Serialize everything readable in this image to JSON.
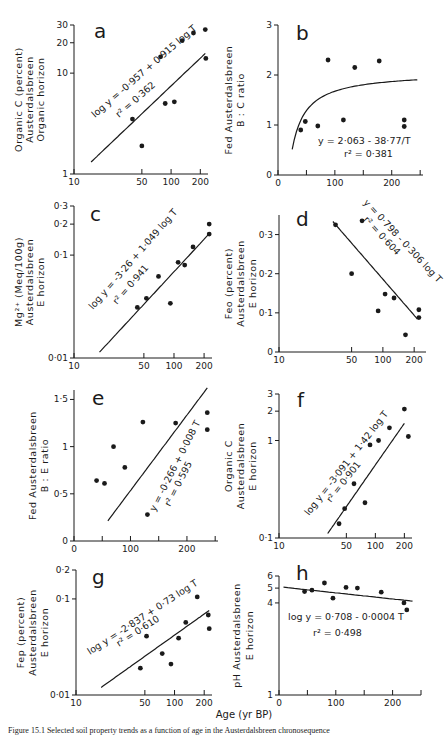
{
  "figure": {
    "shared_xlabel": "Age (yr BP)",
    "caption": "Figure 15.1  Selected soil property trends as a function of age in the Austerdalsbreen chronosequence"
  },
  "chart_data": [
    {
      "id": "a",
      "type": "scatter",
      "panel_label": "a",
      "ylabel": [
        "Organic C (percent)",
        "Austerdalsbreen",
        "Organic horizon"
      ],
      "xscale": "log",
      "yscale": "log",
      "xlim": [
        10,
        240
      ],
      "ylim": [
        1,
        30
      ],
      "xticks": [
        10,
        50,
        100,
        200
      ],
      "xticklabels": [
        "10",
        "50",
        "100",
        "200"
      ],
      "yticks": [
        1,
        10,
        20,
        30
      ],
      "yticklabels": [
        "1",
        "10",
        "20",
        "30"
      ],
      "points": [
        [
          40,
          3.5
        ],
        [
          50,
          1.9
        ],
        [
          78,
          14.5
        ],
        [
          87,
          5.0
        ],
        [
          108,
          5.2
        ],
        [
          130,
          21
        ],
        [
          170,
          25
        ],
        [
          225,
          27
        ],
        [
          228,
          14
        ]
      ],
      "fit": {
        "kind": "log-log",
        "a": -0.957,
        "b": 0.915,
        "xrange": [
          15,
          225
        ]
      },
      "equation": "log y = -0.957 + 0.915 log T",
      "r2": "r² = 0.362"
    },
    {
      "id": "b",
      "type": "scatter",
      "panel_label": "b",
      "ylabel": [
        "Fed Austerdalsbreen",
        "B : C ratio"
      ],
      "xscale": "linear",
      "yscale": "linear",
      "xlim": [
        0,
        255
      ],
      "ylim": [
        0,
        3
      ],
      "xticks": [
        0,
        50,
        100,
        150,
        200,
        250
      ],
      "xticklabels": [
        "0",
        "",
        "100",
        "",
        "200",
        ""
      ],
      "yticks": [
        0,
        1,
        2,
        3
      ],
      "yticklabels": [
        "0",
        "1",
        "2",
        "3"
      ],
      "points": [
        [
          40,
          0.9
        ],
        [
          48,
          1.07
        ],
        [
          70,
          0.98
        ],
        [
          88,
          2.3
        ],
        [
          115,
          1.1
        ],
        [
          135,
          2.15
        ],
        [
          178,
          2.28
        ],
        [
          222,
          1.1
        ],
        [
          222,
          0.97
        ]
      ],
      "fit": {
        "kind": "hyperbolic",
        "a": 2.063,
        "b": -38.77,
        "xrange": [
          25,
          245
        ]
      },
      "equation": "y = 2.063 - 38.77/T",
      "r2": "r² = 0.381"
    },
    {
      "id": "c",
      "type": "scatter",
      "panel_label": "c",
      "ylabel": [
        "Mg²⁺ (Meq/100g)",
        "Austerdalsbreen",
        "E horizon"
      ],
      "xscale": "log",
      "yscale": "log",
      "xlim": [
        10,
        240
      ],
      "ylim": [
        0.01,
        0.3
      ],
      "xticks": [
        10,
        50,
        100,
        200
      ],
      "xticklabels": [
        "10",
        "50",
        "100",
        "200"
      ],
      "yticks": [
        0.01,
        0.1,
        0.2,
        0.3
      ],
      "yticklabels": [
        "0.01",
        "0.1",
        "0.2",
        "0.3"
      ],
      "points": [
        [
          43,
          0.031
        ],
        [
          53,
          0.038
        ],
        [
          70,
          0.062
        ],
        [
          92,
          0.034
        ],
        [
          110,
          0.085
        ],
        [
          128,
          0.08
        ],
        [
          155,
          0.12
        ],
        [
          225,
          0.2
        ],
        [
          225,
          0.16
        ]
      ],
      "fit": {
        "kind": "log-log",
        "a": -3.26,
        "b": 1.049,
        "xrange": [
          18,
          225
        ]
      },
      "equation": "log y = -3.26 + 1.049 log T",
      "r2": "r² = 0.941"
    },
    {
      "id": "d",
      "type": "scatter",
      "panel_label": "d",
      "ylabel": [
        "Feo (percent)",
        "Austerdalsbreen",
        "E horizon"
      ],
      "xscale": "log",
      "yscale": "linear",
      "xlim": [
        10,
        260
      ],
      "ylim": [
        0,
        0.35
      ],
      "xticks": [
        10,
        50,
        100,
        200
      ],
      "xticklabels": [
        "10",
        "50",
        "100",
        "200"
      ],
      "yticks": [
        0,
        0.1,
        0.2,
        0.3
      ],
      "yticklabels": [
        "0",
        "0.1",
        "0.2",
        "0.3"
      ],
      "points": [
        [
          35,
          0.325
        ],
        [
          50,
          0.2
        ],
        [
          63,
          0.335
        ],
        [
          90,
          0.105
        ],
        [
          105,
          0.148
        ],
        [
          128,
          0.138
        ],
        [
          165,
          0.044
        ],
        [
          222,
          0.108
        ],
        [
          222,
          0.088
        ]
      ],
      "fit": {
        "kind": "lin-log",
        "a": 0.798,
        "b": -0.306,
        "xrange": [
          33,
          215
        ]
      },
      "equation": "y = 0.798 - 0.306 log T",
      "r2": "r² = 0.604"
    },
    {
      "id": "e",
      "type": "scatter",
      "panel_label": "e",
      "ylabel": [
        "Fed Austerdalsbreen",
        "B : E ratio"
      ],
      "xscale": "linear",
      "yscale": "linear",
      "xlim": [
        0,
        255
      ],
      "ylim": [
        0,
        1.6
      ],
      "xticks": [
        0,
        50,
        100,
        150,
        200,
        250
      ],
      "xticklabels": [
        "0",
        "",
        "100",
        "",
        "200",
        ""
      ],
      "yticks": [
        0,
        0.5,
        1,
        1.5
      ],
      "yticklabels": [
        "0",
        "0.5",
        "1",
        "1.5"
      ],
      "points": [
        [
          40,
          0.64
        ],
        [
          54,
          0.61
        ],
        [
          70,
          1.0
        ],
        [
          90,
          0.78
        ],
        [
          122,
          1.26
        ],
        [
          130,
          0.28
        ],
        [
          180,
          1.25
        ],
        [
          236,
          1.36
        ],
        [
          236,
          1.18
        ]
      ],
      "fit": {
        "kind": "linear",
        "a": -0.266,
        "b": 0.008,
        "xrange": [
          60,
          236
        ]
      },
      "equation": "y = -0.266 + 0.008 T",
      "r2": "r² = 0.595"
    },
    {
      "id": "f",
      "type": "scatter",
      "panel_label": "f",
      "ylabel": [
        "Organic C",
        "Austerdalsbreen",
        "E horizon"
      ],
      "xscale": "log",
      "yscale": "log",
      "xlim": [
        10,
        240
      ],
      "ylim": [
        0.1,
        3
      ],
      "xticks": [
        10,
        50,
        100,
        200
      ],
      "xticklabels": [
        "10",
        "50",
        "100",
        "200"
      ],
      "yticks": [
        0.1,
        1,
        2,
        3
      ],
      "yticklabels": [
        "0.1",
        "1",
        "2",
        "3"
      ],
      "points": [
        [
          42,
          0.14
        ],
        [
          48,
          0.2
        ],
        [
          60,
          0.36
        ],
        [
          78,
          0.23
        ],
        [
          88,
          0.9
        ],
        [
          108,
          1.0
        ],
        [
          140,
          1.35
        ],
        [
          200,
          2.1
        ],
        [
          220,
          1.1
        ]
      ],
      "fit": {
        "kind": "log-log",
        "a": -3.091,
        "b": 1.42,
        "xrange": [
          32,
          200
        ]
      },
      "equation": "log y = -3.091 + 1.42 log T",
      "r2": "r² = 0.901"
    },
    {
      "id": "g",
      "type": "scatter",
      "panel_label": "g",
      "ylabel": [
        "Fep (percent)",
        "Austerdalsbreen",
        "E horizon"
      ],
      "xscale": "log",
      "yscale": "log",
      "xlim": [
        10,
        240
      ],
      "ylim": [
        0.01,
        0.2
      ],
      "xticks": [
        10,
        50,
        100,
        200
      ],
      "xticklabels": [
        "10",
        "50",
        "100",
        "200"
      ],
      "yticks": [
        0.01,
        0.1,
        0.2
      ],
      "yticklabels": [
        "0.01",
        "0.1",
        "0.2"
      ],
      "points": [
        [
          45,
          0.019
        ],
        [
          52,
          0.041
        ],
        [
          75,
          0.027
        ],
        [
          92,
          0.021
        ],
        [
          110,
          0.039
        ],
        [
          130,
          0.057
        ],
        [
          170,
          0.105
        ],
        [
          220,
          0.068
        ],
        [
          225,
          0.049
        ]
      ],
      "fit": {
        "kind": "log-log",
        "a": -2.837,
        "b": 0.73,
        "xrange": [
          18,
          225
        ]
      },
      "equation": "log y = -2.837 + 0.73 log T",
      "r2": "r² = 0.610"
    },
    {
      "id": "h",
      "type": "scatter",
      "panel_label": "h",
      "ylabel": [
        "pH Austerdalsbreen",
        "E horizon"
      ],
      "xscale": "linear",
      "yscale": "log",
      "xlim": [
        0,
        250
      ],
      "ylim": [
        1,
        6
      ],
      "xticks": [
        0,
        50,
        100,
        150,
        200,
        250
      ],
      "xticklabels": [
        "0",
        "",
        "100",
        "",
        "200",
        ""
      ],
      "yticks": [
        1,
        4,
        5,
        6
      ],
      "yticklabels": [
        "1",
        "4",
        "5",
        "6"
      ],
      "points": [
        [
          45,
          4.75
        ],
        [
          58,
          4.85
        ],
        [
          80,
          5.4
        ],
        [
          95,
          4.3
        ],
        [
          118,
          5.05
        ],
        [
          138,
          5.0
        ],
        [
          180,
          4.7
        ],
        [
          220,
          4.0
        ],
        [
          225,
          3.6
        ]
      ],
      "fit": {
        "kind": "log-lin",
        "a": 0.708,
        "b": -0.0004,
        "xrange": [
          8,
          235
        ]
      },
      "equation": "log y = 0.708 - 0.0004 T",
      "r2": "r² = 0.498"
    }
  ],
  "layout": {
    "panels": [
      {
        "x0": 74,
        "x1": 208,
        "y0": 174,
        "y1": 25,
        "ticklen": 5,
        "label_pos": [
          94,
          38
        ],
        "ylabel_x": [
          22,
          33,
          44
        ],
        "eq_pos": [
          95,
          118
        ],
        "eq_rot": -41,
        "r2_pos": [
          119,
          118
        ],
        "r2_rot": -41
      },
      {
        "x0": 278,
        "x1": 423,
        "y0": 175,
        "y1": 25,
        "ticklen": 5,
        "label_pos": [
          296,
          40
        ],
        "ylabel_x": [
          232,
          244
        ],
        "eq_pos": [
          318,
          144
        ],
        "eq_rot": 0,
        "r2_pos": [
          344,
          157
        ],
        "r2_rot": 0
      },
      {
        "x0": 74,
        "x1": 212,
        "y0": 358,
        "y1": 206,
        "ticklen": 5,
        "label_pos": [
          90,
          221
        ],
        "ylabel_x": [
          22,
          33,
          44
        ],
        "eq_pos": [
          93,
          310
        ],
        "eq_rot": -49,
        "r2_pos": [
          117,
          305
        ],
        "r2_rot": -49
      },
      {
        "x0": 279,
        "x1": 426,
        "y0": 352,
        "y1": 215,
        "ticklen": 5,
        "label_pos": [
          296,
          226
        ],
        "ylabel_x": [
          232,
          244,
          256
        ],
        "eq_pos": [
          363,
          203
        ],
        "eq_rot": 47,
        "r2_pos": [
          363,
          220
        ],
        "r2_rot": 47
      },
      {
        "x0": 74,
        "x1": 218,
        "y0": 541,
        "y1": 390,
        "ticklen": 5,
        "label_pos": [
          92,
          405
        ],
        "ylabel_x": [
          36,
          48
        ],
        "eq_pos": [
          155,
          512
        ],
        "eq_rot": -63,
        "r2_pos": [
          170,
          507
        ],
        "r2_rot": -63
      },
      {
        "x0": 279,
        "x1": 412,
        "y0": 538,
        "y1": 394,
        "ticklen": 5,
        "label_pos": [
          297,
          407
        ],
        "ylabel_x": [
          232,
          244,
          256
        ],
        "eq_pos": [
          309,
          516
        ],
        "eq_rot": -52,
        "r2_pos": [
          331,
          503
        ],
        "r2_rot": -52
      },
      {
        "x0": 76,
        "x1": 212,
        "y0": 695,
        "y1": 570,
        "ticklen": 5,
        "label_pos": [
          92,
          584
        ],
        "ylabel_x": [
          24,
          36,
          48
        ],
        "eq_pos": [
          90,
          655
        ],
        "eq_rot": -33,
        "r2_pos": [
          119,
          647
        ],
        "r2_rot": -33
      },
      {
        "x0": 279,
        "x1": 421,
        "y0": 695,
        "y1": 576,
        "ticklen": 5,
        "label_pos": [
          296,
          580
        ],
        "ylabel_x": [
          240,
          253
        ],
        "eq_pos": [
          288,
          620
        ],
        "eq_rot": 0,
        "r2_pos": [
          313,
          636
        ],
        "r2_rot": 0
      }
    ],
    "ink": "#1a1a1a"
  }
}
